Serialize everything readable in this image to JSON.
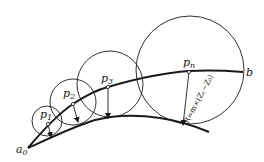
{
  "diagram": {
    "title": "",
    "colors": {
      "stroke": "#1a1a1a",
      "background": "#ffffff"
    },
    "labels": {
      "start": "a",
      "start_sub": "0",
      "end": "b",
      "p1": "p",
      "p1_sub": "1",
      "p2": "p",
      "p2_sub": "2",
      "p3": "p",
      "p3_sub": "3",
      "pn": "p",
      "pn_sub": "n",
      "formula": "R=m×(Zₙ−Z₀)"
    },
    "points": [
      {
        "name": "p1",
        "x": 48,
        "y": 124,
        "circle_r": 15,
        "arrow_to": [
          50,
          138
        ]
      },
      {
        "name": "p2",
        "x": 73,
        "y": 104,
        "circle_r": 23,
        "arrow_to": [
          78,
          122
        ]
      },
      {
        "name": "p3",
        "x": 108,
        "y": 87,
        "circle_r": 32,
        "arrow_to": [
          108,
          118
        ]
      },
      {
        "name": "pn",
        "x": 189,
        "y": 72,
        "circle_r": 54,
        "arrow_to": [
          182,
          125
        ]
      }
    ],
    "curves": {
      "upper": "from a0 through p1, p2, p3, pn to b",
      "lower": "from a0 along lower boundary tangent to circles"
    }
  }
}
